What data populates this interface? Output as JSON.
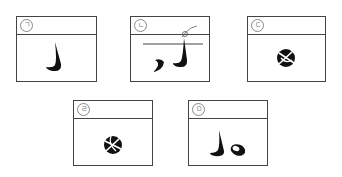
{
  "panels": [
    {
      "label": "ㄱ",
      "content": "crescent-hook-shape"
    },
    {
      "label": "ㄴ",
      "content": "horizon-line-with-two-crescents"
    },
    {
      "label": "ㄷ",
      "content": "circle-with-cross-shape"
    },
    {
      "label": "ㄹ",
      "content": "circle-with-cross-shape-rotated"
    },
    {
      "label": "ㅁ",
      "content": "hook-shape-and-oval"
    }
  ],
  "colors": {
    "stroke": "#444444",
    "fill": "#111111"
  }
}
